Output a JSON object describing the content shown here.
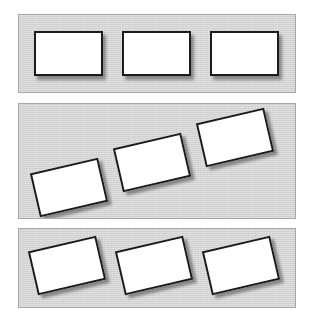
{
  "figure": {
    "canvas": {
      "width": 311,
      "height": 324
    },
    "background_color": "#ffffff",
    "panel_fill_color": "#d5d5d5",
    "panel_border_color": "#a8a8a8",
    "card_fill_color": "#ffffff",
    "card_border_color": "#1b1b1b",
    "card_shadow_color": "rgba(0,0,0,0.38)"
  },
  "panels": [
    {
      "name": "panel-top",
      "label": "Top panel",
      "arrangement": "horizontal-aligned",
      "x": 18,
      "y": 14,
      "width": 278,
      "height": 79,
      "cards": [
        {
          "name": "card-1",
          "x": 34,
          "y": 31,
          "width": 69,
          "height": 45,
          "rotation": 0
        },
        {
          "name": "card-2",
          "x": 122,
          "y": 31,
          "width": 69,
          "height": 45,
          "rotation": 0
        },
        {
          "name": "card-3",
          "x": 210,
          "y": 31,
          "width": 69,
          "height": 45,
          "rotation": 0
        }
      ]
    },
    {
      "name": "panel-middle",
      "label": "Middle panel",
      "arrangement": "rotated-ascending-diagonal",
      "x": 18,
      "y": 103,
      "width": 278,
      "height": 116,
      "cards": [
        {
          "name": "card-1",
          "x": 34,
          "y": 165,
          "width": 70,
          "height": 45,
          "rotation": -13
        },
        {
          "name": "card-2",
          "x": 117,
          "y": 140,
          "width": 70,
          "height": 45,
          "rotation": -13
        },
        {
          "name": "card-3",
          "x": 200,
          "y": 115,
          "width": 70,
          "height": 45,
          "rotation": -13
        }
      ]
    },
    {
      "name": "panel-bottom",
      "label": "Bottom panel",
      "arrangement": "rotated-level-baseline",
      "x": 18,
      "y": 228,
      "width": 278,
      "height": 80,
      "cards": [
        {
          "name": "card-1",
          "x": 32,
          "y": 243,
          "width": 70,
          "height": 45,
          "rotation": -13
        },
        {
          "name": "card-2",
          "x": 119,
          "y": 243,
          "width": 70,
          "height": 45,
          "rotation": -13
        },
        {
          "name": "card-3",
          "x": 206,
          "y": 243,
          "width": 70,
          "height": 45,
          "rotation": -13
        }
      ]
    }
  ]
}
